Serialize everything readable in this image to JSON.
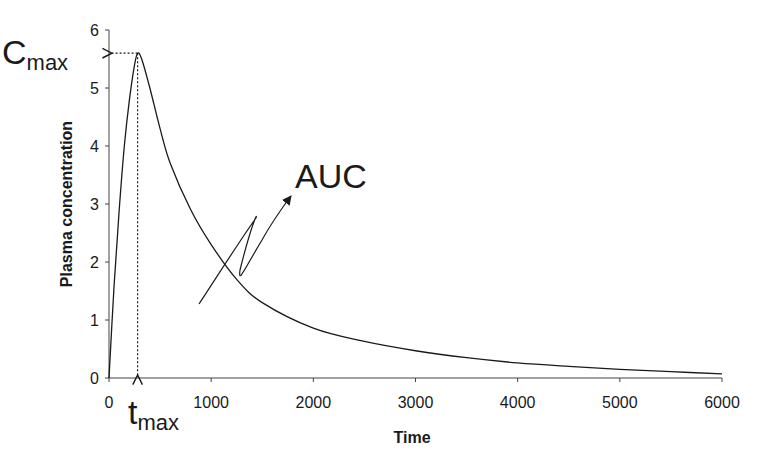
{
  "chart_data": {
    "type": "line",
    "title": "",
    "xlabel": "Time",
    "ylabel": "Plasma concentration",
    "xlim": [
      0,
      6000
    ],
    "ylim": [
      0,
      6
    ],
    "grid": false,
    "legend": null,
    "x_ticks": [
      "0",
      "1000",
      "2000",
      "3000",
      "4000",
      "5000",
      "6000"
    ],
    "y_ticks": [
      "0",
      "1",
      "2",
      "3",
      "4",
      "5",
      "6"
    ],
    "series": [
      {
        "name": "Plasma concentration",
        "x": [
          0,
          50,
          100,
          150,
          200,
          250,
          280,
          320,
          400,
          500,
          600,
          800,
          1000,
          1250,
          1500,
          2000,
          2500,
          3000,
          3500,
          4000,
          4500,
          5000,
          5500,
          6000
        ],
        "values": [
          0,
          1.6,
          2.9,
          4.0,
          4.8,
          5.4,
          5.6,
          5.5,
          5.0,
          4.3,
          3.7,
          2.9,
          2.3,
          1.7,
          1.3,
          0.86,
          0.63,
          0.47,
          0.35,
          0.26,
          0.2,
          0.15,
          0.11,
          0.07
        ]
      }
    ],
    "annotations": {
      "cmax": {
        "label": "C",
        "subscript": "max",
        "value": 5.6
      },
      "tmax": {
        "label": "t",
        "subscript": "max",
        "value": 280
      },
      "auc": {
        "label": "AUC"
      }
    }
  }
}
